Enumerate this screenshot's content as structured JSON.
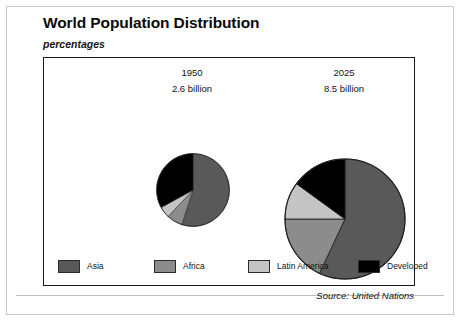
{
  "header": {
    "title": "World Population Distribution",
    "subtitle": "percentages"
  },
  "columns": [
    {
      "year": "1950",
      "amount": "2.6 billion"
    },
    {
      "year": "2025",
      "amount": "8.5 billion"
    }
  ],
  "legend": [
    {
      "label": "Asia",
      "color": "#595959"
    },
    {
      "label": "Africa",
      "color": "#8c8c8c"
    },
    {
      "label": "Latin America",
      "color": "#c4c4c4"
    },
    {
      "label": "Developed",
      "color": "#000000"
    }
  ],
  "footer": {
    "source": "Source: United Nations"
  },
  "chart_data": {
    "type": "pie",
    "title": "World Population Distribution",
    "subtitle": "percentages",
    "units": "percent of world population",
    "legend_position": "bottom",
    "categories": [
      "Asia",
      "Africa",
      "Latin America",
      "Developed"
    ],
    "colors": [
      "#595959",
      "#8c8c8c",
      "#c4c4c4",
      "#000000"
    ],
    "charts": [
      {
        "name": "1950",
        "label": "1950",
        "total_population": "2.6 billion",
        "radius_px": 37,
        "start_angle_deg": 0,
        "values": [
          55,
          7,
          5,
          33
        ],
        "slices": [
          {
            "category": "Asia",
            "value": 55,
            "color": "#595959"
          },
          {
            "category": "Africa",
            "value": 7,
            "color": "#8c8c8c"
          },
          {
            "category": "Latin America",
            "value": 5,
            "color": "#c4c4c4"
          },
          {
            "category": "Developed",
            "value": 33,
            "color": "#000000"
          }
        ]
      },
      {
        "name": "2025",
        "label": "2025",
        "total_population": "8.5 billion",
        "radius_px": 61,
        "start_angle_deg": 0,
        "values": [
          57,
          18,
          10,
          15
        ],
        "slices": [
          {
            "category": "Asia",
            "value": 57,
            "color": "#595959"
          },
          {
            "category": "Africa",
            "value": 18,
            "color": "#8c8c8c"
          },
          {
            "category": "Latin America",
            "value": 10,
            "color": "#c4c4c4"
          },
          {
            "category": "Developed",
            "value": 15,
            "color": "#000000"
          }
        ]
      }
    ],
    "source": "Source: United Nations"
  }
}
